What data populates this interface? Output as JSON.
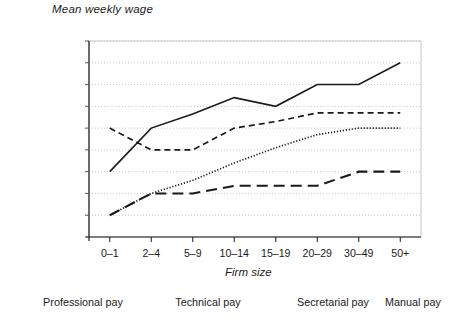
{
  "chart_title": "Mean weekly wage",
  "axis": {
    "x_title": "Firm size",
    "y_title": "Mean weekly wage"
  },
  "chart_data": {
    "type": "line",
    "title": "Mean weekly wage",
    "xlabel": "Firm size",
    "ylabel": "Mean weekly wage",
    "grid": true,
    "legend_position": "bottom",
    "categories": [
      "0–1",
      "2–4",
      "5–9",
      "10–14",
      "15–19",
      "20–29",
      "30–49",
      "50+"
    ],
    "y_categories": [
      "less than £50",
      "£50–74",
      "£75–99",
      "£100–24",
      "£125–49",
      "£150–99",
      "£200–49",
      "£250–99",
      "£300–99",
      "£400+"
    ],
    "ylim": [
      0,
      9
    ],
    "series": [
      {
        "name": "Professional pay",
        "style": "solid",
        "values": [
          3.0,
          5.0,
          5.65,
          6.4,
          6.0,
          7.0,
          7.0,
          8.0
        ],
        "value_labels": [
          "£100–24",
          "£150–99",
          "between £150–99 and £200–49",
          "just above £200–49",
          "£200–49",
          "£250–99",
          "£250–99",
          "£300–99"
        ]
      },
      {
        "name": "Technical pay",
        "style": "dashed",
        "values": [
          5.0,
          4.0,
          4.0,
          5.0,
          5.3,
          5.7,
          5.7,
          5.7
        ],
        "value_labels": [
          "£150–99",
          "£125–49",
          "£125–49",
          "£150–99",
          "just above £150–99",
          "approaching £200–49",
          "approaching £200–49",
          "approaching £200–49"
        ]
      },
      {
        "name": "Secretarial pay",
        "style": "dotted",
        "values": [
          1.0,
          2.0,
          2.6,
          3.4,
          4.1,
          4.7,
          5.0,
          5.0
        ],
        "value_labels": [
          "£50–74",
          "£75–99",
          "above £75–99",
          "above £100–24",
          "above £125–49",
          "approaching £150–99",
          "£150–99",
          "£150–99"
        ]
      },
      {
        "name": "Manual pay",
        "style": "longdash",
        "values": [
          1.0,
          2.0,
          2.0,
          2.35,
          2.35,
          2.35,
          3.0,
          3.0
        ],
        "value_labels": [
          "£50–74",
          "£75–99",
          "£75–99",
          "above £75–99",
          "above £75–99",
          "above £75–99",
          "£100–24",
          "£100–24"
        ]
      }
    ]
  },
  "legend": [
    {
      "label": "Professional pay",
      "style": "solid"
    },
    {
      "label": "Technical pay",
      "style": "dashed"
    },
    {
      "label": "Secretarial pay",
      "style": "dotted"
    },
    {
      "label": "Manual pay",
      "style": "longdash"
    }
  ],
  "colors": {
    "ink": "#1a1a1a",
    "grid": "#c8c8c8",
    "axis": "#555555",
    "background": "#ffffff"
  }
}
